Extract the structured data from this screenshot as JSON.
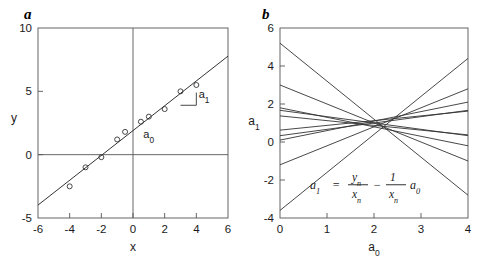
{
  "figure": {
    "panels": [
      {
        "id": "a",
        "label": "a",
        "xlabel": "x",
        "ylabel": "y",
        "annotations": [
          {
            "name": "intercept-annotation",
            "text": "a",
            "sub": "0"
          },
          {
            "name": "slope-annotation",
            "text": "a",
            "sub": "1"
          }
        ]
      },
      {
        "id": "b",
        "label": "b",
        "xlabel": "a",
        "xlabel_sub": "0",
        "ylabel": "a",
        "ylabel_sub": "1",
        "equation": {
          "lhs": "a",
          "lhs_sub": "1",
          "eq": "=",
          "term1_num": "y",
          "term1_num_sub": "n",
          "term1_den": "x",
          "term1_den_sub": "n",
          "minus": "−",
          "term2_num": "1",
          "term2_den": "x",
          "term2_den_sub": "n",
          "term2_var": "a",
          "term2_var_sub": "0"
        }
      }
    ]
  },
  "chart_data": [
    {
      "type": "scatter",
      "title": "a",
      "xlabel": "x",
      "ylabel": "y",
      "xlim": [
        -6,
        6
      ],
      "ylim": [
        -5,
        10
      ],
      "xticks": [
        -6,
        -4,
        -2,
        0,
        2,
        4,
        6
      ],
      "yticks": [
        -5,
        0,
        5,
        10
      ],
      "grid": false,
      "legend": "none",
      "points": [
        {
          "x": -4.0,
          "y": -2.5
        },
        {
          "x": -3.0,
          "y": -1.0
        },
        {
          "x": -2.0,
          "y": -0.2
        },
        {
          "x": -1.0,
          "y": 1.2
        },
        {
          "x": -0.5,
          "y": 1.8
        },
        {
          "x": 0.5,
          "y": 2.6
        },
        {
          "x": 1.0,
          "y": 3.0
        },
        {
          "x": 2.0,
          "y": 3.6
        },
        {
          "x": 3.0,
          "y": 5.0
        },
        {
          "x": 4.0,
          "y": 5.5
        }
      ],
      "fit_line": {
        "name": "least-squares-fit",
        "intercept": 1.9,
        "slope": 0.98,
        "x_start": -6,
        "x_end": 6
      },
      "slope_triangle": {
        "x0": 3.0,
        "x1": 4.0,
        "y_base": 3.9,
        "y_top": 4.9
      },
      "annotations": [
        {
          "label": "a0",
          "text": "a",
          "sub": "0",
          "x": 0.65,
          "y": 1.35
        },
        {
          "label": "a1",
          "text": "a",
          "sub": "1",
          "x": 4.15,
          "y": 4.45
        }
      ],
      "axis_lines": {
        "x_zero": 0,
        "y_zero": 0
      }
    },
    {
      "type": "line",
      "title": "b",
      "xlabel": "a0",
      "ylabel": "a1",
      "xlim": [
        0,
        4
      ],
      "ylim": [
        -4,
        6
      ],
      "xticks": [
        0,
        1,
        2,
        3,
        4
      ],
      "yticks": [
        -4,
        -2,
        0,
        2,
        4,
        6
      ],
      "grid": false,
      "legend": "none",
      "description": "Each data point (xn,yn) of panel a maps to a line a1 = yn/xn - (1/xn)*a0; all lines intersect near (2, 1).",
      "series": [
        {
          "name": "x=-4, y=-2.5",
          "intercept": 0.625,
          "slope": 0.25
        },
        {
          "name": "x=-3, y=-1.0",
          "intercept": 0.333,
          "slope": 0.3333
        },
        {
          "name": "x=-2, y=-0.2",
          "intercept": 0.1,
          "slope": 0.5
        },
        {
          "name": "x=-1, y=1.2",
          "intercept": -1.2,
          "slope": 1.0
        },
        {
          "name": "x=-0.5, y=1.8",
          "intercept": -3.6,
          "slope": 2.0
        },
        {
          "name": "x=0.5, y=2.6",
          "intercept": 5.2,
          "slope": -2.0
        },
        {
          "name": "x=1, y=3.0",
          "intercept": 3.0,
          "slope": -1.0
        },
        {
          "name": "x=2, y=3.6",
          "intercept": 1.8,
          "slope": -0.5
        },
        {
          "name": "x=3, y=5.0",
          "intercept": 1.667,
          "slope": -0.3333
        },
        {
          "name": "x=4, y=5.5",
          "intercept": 1.375,
          "slope": -0.25
        }
      ],
      "intersection": {
        "a0": 2.0,
        "a1": 1.0
      }
    }
  ]
}
